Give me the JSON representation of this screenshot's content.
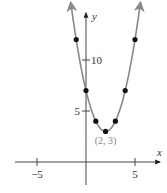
{
  "chart_data": {
    "type": "line",
    "title": "",
    "function": "y = (x - 2)^2 + 3",
    "xlabel": "x",
    "ylabel": "y",
    "xlim": [
      -7,
      8
    ],
    "ylim": [
      -3,
      15
    ],
    "x_ticks": [
      {
        "value": -5,
        "label": "−5"
      },
      {
        "value": 5,
        "label": "5"
      }
    ],
    "y_ticks": [
      {
        "value": 5,
        "label": "5"
      },
      {
        "value": 10,
        "label": "10"
      }
    ],
    "grid": false,
    "series": [
      {
        "name": "parabola",
        "color": "#888888",
        "points": [
          {
            "x": -1,
            "y": 12
          },
          {
            "x": 0,
            "y": 7
          },
          {
            "x": 1,
            "y": 4
          },
          {
            "x": 2,
            "y": 3
          },
          {
            "x": 3,
            "y": 4
          },
          {
            "x": 4,
            "y": 7
          },
          {
            "x": 5,
            "y": 12
          }
        ]
      }
    ],
    "annotations": [
      {
        "x": 2,
        "y": 3,
        "text": "(2, 3)"
      }
    ]
  }
}
